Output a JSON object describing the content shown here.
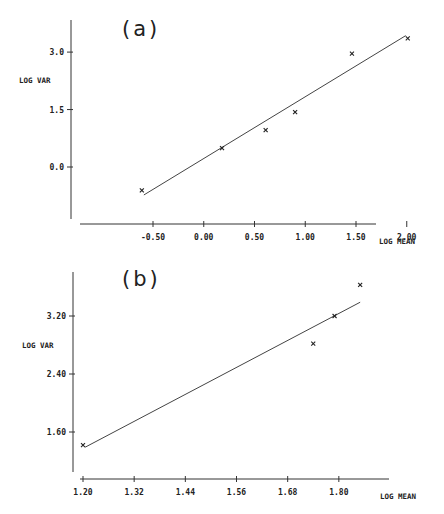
{
  "chart_data": [
    {
      "type": "scatter",
      "title": "(a)",
      "xlabel": "LOG MEAN",
      "ylabel": "LOG VAR",
      "xlim": [
        -0.62,
        2.18
      ],
      "ylim": [
        -1.5,
        3.8
      ],
      "x_ticks": [
        -0.5,
        0.0,
        0.5,
        1.0,
        1.5,
        2.0
      ],
      "x_tick_labels": [
        "-0.50",
        "0.00",
        "0.50",
        "1.00",
        "1.50",
        "2.00"
      ],
      "y_ticks": [
        0.0,
        1.5,
        3.0
      ],
      "y_tick_labels": [
        "0.0",
        "1.5",
        "3.0"
      ],
      "grid": false,
      "marker": "x",
      "points": [
        {
          "x": -0.61,
          "y": -0.61
        },
        {
          "x": 0.18,
          "y": 0.49
        },
        {
          "x": 0.61,
          "y": 0.96
        },
        {
          "x": 0.9,
          "y": 1.43
        },
        {
          "x": 1.46,
          "y": 2.96
        },
        {
          "x": 2.01,
          "y": 3.36
        }
      ],
      "fit_line": {
        "x": [
          -0.59,
          1.99
        ],
        "y": [
          -0.73,
          3.43
        ]
      }
    },
    {
      "type": "scatter",
      "title": "(b)",
      "xlabel": "LOG MEAN",
      "ylabel": "LOG VAR",
      "xlim": [
        1.177,
        1.9
      ],
      "ylim": [
        1.25,
        3.9
      ],
      "x_ticks": [
        1.2,
        1.32,
        1.44,
        1.56,
        1.68,
        1.8
      ],
      "x_tick_labels": [
        "1.20",
        "1.32",
        "1.44",
        "1.56",
        "1.68",
        "1.80"
      ],
      "y_ticks": [
        1.6,
        2.4,
        3.2
      ],
      "y_tick_labels": [
        "1.60",
        "2.40",
        "3.20"
      ],
      "grid": false,
      "marker": "x",
      "points": [
        {
          "x": 1.2,
          "y": 1.42
        },
        {
          "x": 1.74,
          "y": 2.82
        },
        {
          "x": 1.79,
          "y": 3.2
        },
        {
          "x": 1.85,
          "y": 3.63
        }
      ],
      "fit_line": {
        "x": [
          1.205,
          1.85
        ],
        "y": [
          1.39,
          3.39
        ]
      }
    }
  ]
}
